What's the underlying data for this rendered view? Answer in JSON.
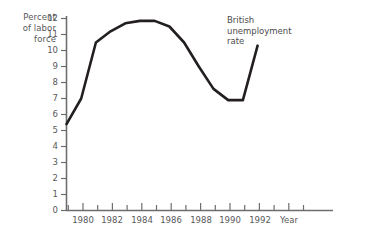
{
  "axes": {
    "ylabel_lines": [
      "Percent",
      "of labor",
      "force"
    ],
    "xlabel": "Year",
    "yticks": [
      "0",
      "1",
      "2",
      "3",
      "4",
      "5",
      "6",
      "7",
      "8",
      "9",
      "10",
      "11",
      "12"
    ],
    "xticks_labeled": [
      "1980",
      "1982",
      "1984",
      "1986",
      "1988",
      "1990",
      "1992"
    ]
  },
  "annotation": {
    "lines": [
      "British",
      "unemployment",
      "rate"
    ]
  },
  "style": {
    "line_color": "#231f20",
    "axis_color": "#6d6e70",
    "text_color": "#58585a",
    "background": "#ffffff"
  },
  "chart_data": {
    "type": "line",
    "title": "British unemployment rate",
    "xlabel": "Year",
    "ylabel": "Percent of labor force",
    "xlim": [
      1979,
      1992.3
    ],
    "ylim": [
      0,
      12
    ],
    "grid": false,
    "legend": "none",
    "annotations": [
      {
        "text": "British unemployment rate",
        "x": 1987.2,
        "y": 11.2
      }
    ],
    "x": [
      1979,
      1980,
      1981,
      1982,
      1983,
      1984,
      1985,
      1986,
      1987,
      1988,
      1989,
      1990,
      1991,
      1992
    ],
    "series": [
      {
        "name": "British unemployment rate",
        "values": [
          5.4,
          7.0,
          10.5,
          11.2,
          11.7,
          11.85,
          11.85,
          11.5,
          10.5,
          9.0,
          7.6,
          6.9,
          6.9,
          10.3
        ]
      }
    ]
  }
}
